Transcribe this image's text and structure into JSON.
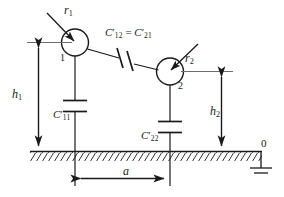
{
  "figure": {
    "stroke_color": "#1a1a1a",
    "background_color": "#ffffff",
    "labels": {
      "radius_1": {
        "symbol": "r",
        "subscript": "1"
      },
      "radius_2": {
        "symbol": "r",
        "subscript": "2"
      },
      "height_1": {
        "symbol": "h",
        "subscript": "1"
      },
      "height_2": {
        "symbol": "h",
        "subscript": "2"
      },
      "separation": {
        "symbol": "a"
      },
      "node_1": "1",
      "node_2": "2",
      "ground_node": "0",
      "cap_self_1": {
        "symbol": "C",
        "prime": "′",
        "subscript": "11"
      },
      "cap_self_2": {
        "symbol": "C",
        "prime": "′",
        "subscript": "22"
      },
      "cap_mutual": {
        "left_symbol": "C",
        "left_prime": "′",
        "left_subscript": "12",
        "equals": "=",
        "right_symbol": "C",
        "right_prime": "′",
        "right_subscript": "21"
      }
    },
    "elements": {
      "conductor_1_name": "conductor-circle-1",
      "conductor_2_name": "conductor-circle-2",
      "ground_plane_name": "ground-plane-hatched",
      "earth_symbol_name": "earth-ground-symbol"
    }
  }
}
